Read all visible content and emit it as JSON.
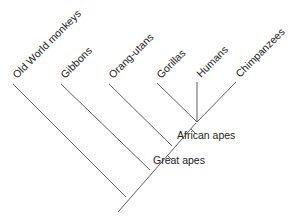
{
  "diagram": {
    "type": "cladogram",
    "leaves": [
      {
        "label": "Old World monkeys"
      },
      {
        "label": "Gibbons"
      },
      {
        "label": "Orang-utans"
      },
      {
        "label": "Gorillas"
      },
      {
        "label": "Humans"
      },
      {
        "label": "Chimpanzees"
      }
    ],
    "clades": [
      {
        "label": "African apes"
      },
      {
        "label": "Great apes"
      }
    ],
    "colors": {
      "line": "#4a4a4a",
      "text": "#222222",
      "background": "#ffffff"
    }
  }
}
